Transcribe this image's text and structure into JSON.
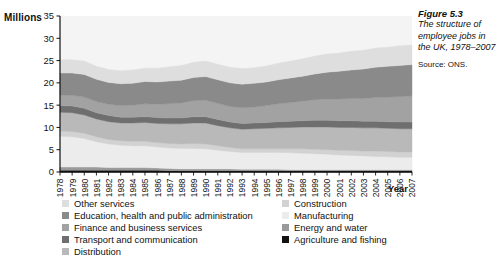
{
  "figure": {
    "number": "Figure 5.3",
    "caption": "The structure of employee jobs in the UK, 1978–2007",
    "source": "Source: ONS."
  },
  "axis": {
    "y_title": "Millions",
    "x_title": "Year"
  },
  "legend": {
    "left": [
      {
        "label": "Other services",
        "color": "#dedede"
      },
      {
        "label": "Education, health and public administration",
        "color": "#8a8a8a"
      },
      {
        "label": "Finance and business services",
        "color": "#a2a2a2"
      },
      {
        "label": "Transport and communication",
        "color": "#6f6f6f"
      },
      {
        "label": "Distribution",
        "color": "#b9b9b9"
      }
    ],
    "right": [
      {
        "label": "Construction",
        "color": "#d2d2d2"
      },
      {
        "label": "Manufacturing",
        "color": "#ececec"
      },
      {
        "label": "Energy and water",
        "color": "#9a9a9a"
      },
      {
        "label": "Agriculture and fishing",
        "color": "#121212"
      }
    ]
  },
  "chart_data": {
    "type": "area",
    "title": "The structure of employee jobs in the UK, 1978–2007",
    "xlabel": "Year",
    "ylabel": "Millions",
    "ylim": [
      0,
      35
    ],
    "yticks": [
      0,
      5,
      10,
      15,
      20,
      25,
      30,
      35
    ],
    "grid": false,
    "legend_position": "bottom",
    "stacked": true,
    "stack_order_bottom_to_top": [
      "Agriculture and fishing",
      "Energy and water",
      "Manufacturing",
      "Construction",
      "Distribution",
      "Transport and communication",
      "Finance and business services",
      "Education, health and public administration",
      "Other services"
    ],
    "categories": [
      1978,
      1979,
      1980,
      1981,
      1982,
      1983,
      1984,
      1985,
      1986,
      1987,
      1988,
      1989,
      1990,
      1991,
      1992,
      1993,
      1994,
      1995,
      1996,
      1997,
      1998,
      1999,
      2000,
      2001,
      2002,
      2003,
      2004,
      2005,
      2006,
      2007
    ],
    "series": [
      {
        "name": "Agriculture and fishing",
        "color": "#121212",
        "values": [
          0.4,
          0.4,
          0.4,
          0.4,
          0.4,
          0.4,
          0.4,
          0.4,
          0.4,
          0.3,
          0.3,
          0.3,
          0.3,
          0.3,
          0.3,
          0.3,
          0.3,
          0.3,
          0.3,
          0.3,
          0.3,
          0.3,
          0.3,
          0.3,
          0.3,
          0.3,
          0.3,
          0.3,
          0.3,
          0.3
        ]
      },
      {
        "name": "Energy and water",
        "color": "#9a9a9a",
        "values": [
          0.7,
          0.7,
          0.7,
          0.7,
          0.6,
          0.6,
          0.6,
          0.6,
          0.5,
          0.5,
          0.4,
          0.4,
          0.4,
          0.4,
          0.4,
          0.3,
          0.3,
          0.3,
          0.3,
          0.2,
          0.2,
          0.2,
          0.2,
          0.2,
          0.2,
          0.2,
          0.2,
          0.2,
          0.2,
          0.2
        ]
      },
      {
        "name": "Manufacturing",
        "color": "#ececec",
        "values": [
          6.9,
          6.8,
          6.4,
          5.7,
          5.3,
          5.0,
          4.9,
          4.9,
          4.7,
          4.6,
          4.6,
          4.6,
          4.5,
          4.2,
          3.9,
          3.8,
          3.8,
          3.8,
          3.8,
          3.8,
          3.7,
          3.6,
          3.5,
          3.3,
          3.2,
          3.1,
          3.0,
          2.9,
          2.8,
          2.8
        ]
      },
      {
        "name": "Construction",
        "color": "#d2d2d2",
        "values": [
          1.2,
          1.2,
          1.2,
          1.1,
          1.0,
          1.0,
          1.0,
          1.0,
          1.0,
          1.0,
          1.0,
          1.1,
          1.1,
          1.0,
          0.9,
          0.8,
          0.8,
          0.8,
          0.8,
          0.9,
          1.0,
          1.0,
          1.0,
          1.1,
          1.1,
          1.1,
          1.2,
          1.2,
          1.2,
          1.2
        ]
      },
      {
        "name": "Distribution",
        "color": "#b9b9b9",
        "values": [
          4.2,
          4.2,
          4.1,
          4.0,
          4.0,
          4.0,
          4.1,
          4.2,
          4.3,
          4.4,
          4.5,
          4.6,
          4.7,
          4.5,
          4.4,
          4.4,
          4.5,
          4.6,
          4.7,
          4.8,
          4.9,
          5.0,
          5.1,
          5.1,
          5.2,
          5.2,
          5.2,
          5.2,
          5.2,
          5.2
        ]
      },
      {
        "name": "Transport and communication",
        "color": "#6f6f6f",
        "values": [
          1.5,
          1.5,
          1.5,
          1.4,
          1.4,
          1.3,
          1.3,
          1.3,
          1.3,
          1.3,
          1.3,
          1.4,
          1.4,
          1.4,
          1.3,
          1.3,
          1.3,
          1.3,
          1.4,
          1.4,
          1.4,
          1.5,
          1.5,
          1.5,
          1.5,
          1.5,
          1.5,
          1.5,
          1.5,
          1.5
        ]
      },
      {
        "name": "Finance and business services",
        "color": "#a2a2a2",
        "values": [
          2.3,
          2.4,
          2.5,
          2.5,
          2.5,
          2.6,
          2.7,
          2.9,
          3.0,
          3.2,
          3.4,
          3.6,
          3.7,
          3.6,
          3.5,
          3.5,
          3.6,
          3.8,
          4.0,
          4.2,
          4.4,
          4.6,
          4.8,
          4.9,
          5.0,
          5.1,
          5.3,
          5.5,
          5.7,
          5.9
        ]
      },
      {
        "name": "Education, health and public administration",
        "color": "#8a8a8a",
        "values": [
          5.0,
          5.0,
          5.1,
          5.0,
          4.9,
          4.9,
          4.9,
          5.0,
          5.0,
          5.1,
          5.1,
          5.2,
          5.3,
          5.3,
          5.3,
          5.3,
          5.3,
          5.3,
          5.4,
          5.5,
          5.6,
          5.8,
          6.0,
          6.2,
          6.4,
          6.6,
          6.8,
          6.9,
          7.0,
          7.0
        ]
      },
      {
        "name": "Other services",
        "color": "#dedede",
        "values": [
          3.0,
          3.0,
          3.0,
          2.9,
          2.9,
          2.9,
          3.0,
          3.0,
          3.1,
          3.2,
          3.3,
          3.4,
          3.5,
          3.5,
          3.5,
          3.5,
          3.5,
          3.6,
          3.7,
          3.8,
          3.9,
          4.0,
          4.1,
          4.1,
          4.2,
          4.2,
          4.3,
          4.3,
          4.4,
          4.4
        ]
      }
    ]
  }
}
